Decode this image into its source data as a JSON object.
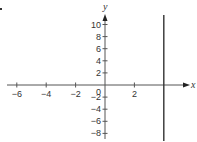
{
  "chart_data": {
    "type": "line",
    "title": "",
    "xlabel": "x",
    "ylabel": "y",
    "xlim": [
      -6,
      5.7
    ],
    "ylim": [
      -9,
      11.5
    ],
    "x_ticks": [
      -6,
      -4,
      -2,
      2
    ],
    "x_tick_labels": [
      "−6",
      "−4",
      "−2",
      "2"
    ],
    "y_ticks": [
      10,
      8,
      6,
      4,
      2,
      -2,
      -4,
      -6,
      -8
    ],
    "y_tick_labels": [
      "10",
      "8",
      "6",
      "4",
      "2",
      "−2",
      "−4",
      "−6",
      "−8"
    ],
    "origin_label": "0",
    "grid": false,
    "legend": "none",
    "series": [
      {
        "name": "x = 4",
        "kind": "vertical-line",
        "x": 4,
        "y_range": [
          -9,
          11
        ],
        "color": "#333333"
      }
    ]
  },
  "colors": {
    "axis": "#555555",
    "line": "#333333",
    "text": "#333333"
  }
}
